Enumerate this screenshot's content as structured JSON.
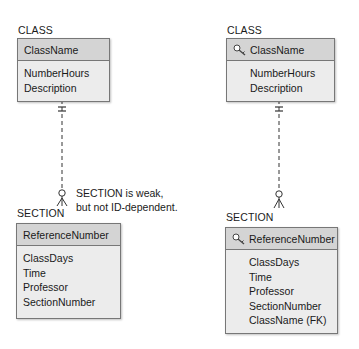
{
  "left": {
    "parent": {
      "entity_label": "CLASS",
      "identifier": "ClassName",
      "attributes": [
        "NumberHours",
        "Description"
      ]
    },
    "child": {
      "entity_label": "SECTION",
      "identifier": "ReferenceNumber",
      "attributes": [
        "ClassDays",
        "Time",
        "Professor",
        "SectionNumber"
      ]
    },
    "note": [
      "SECTION is weak,",
      "but not ID-dependent."
    ]
  },
  "right": {
    "parent": {
      "entity_label": "CLASS",
      "identifier": "ClassName",
      "identifier_icon": "key-icon",
      "attributes": [
        "NumberHours",
        "Description"
      ]
    },
    "child": {
      "entity_label": "SECTION",
      "identifier": "ReferenceNumber",
      "identifier_icon": "key-icon",
      "attributes": [
        "ClassDays",
        "Time",
        "Professor",
        "SectionNumber",
        "ClassName (FK)"
      ]
    }
  }
}
